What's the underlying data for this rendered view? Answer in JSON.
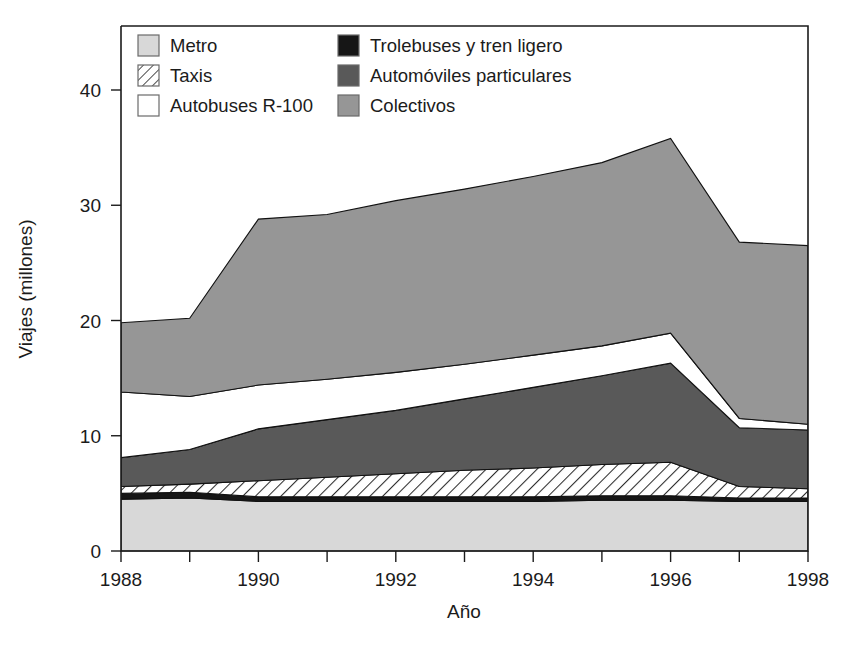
{
  "chart_data": {
    "type": "area",
    "stacked": true,
    "title": "",
    "xlabel": "Año",
    "ylabel": "Viajes (millones)",
    "x": [
      1988,
      1989,
      1990,
      1991,
      1992,
      1993,
      1994,
      1995,
      1996,
      1997,
      1998
    ],
    "xtick_labels": [
      "1988",
      "",
      "1990",
      "",
      "1992",
      "",
      "1994",
      "",
      "1996",
      "",
      "1998"
    ],
    "xlim": [
      1988,
      1998
    ],
    "ylim": [
      0,
      44
    ],
    "ytick_values": [
      0,
      10,
      20,
      30,
      40
    ],
    "ytick_labels": [
      "0",
      "10",
      "20",
      "30",
      "40"
    ],
    "grid": false,
    "legend_position": "top-left-inside",
    "legend_columns": 2,
    "series": [
      {
        "name": "Metro",
        "order": 1,
        "fill": "#d8d8d8",
        "pattern": "solid",
        "values": [
          4.5,
          4.6,
          4.3,
          4.3,
          4.3,
          4.3,
          4.3,
          4.4,
          4.4,
          4.3,
          4.3
        ]
      },
      {
        "name": "Trolebuses y tren ligero",
        "order": 2,
        "fill": "#161616",
        "pattern": "solid",
        "values": [
          0.5,
          0.5,
          0.4,
          0.4,
          0.4,
          0.4,
          0.4,
          0.4,
          0.4,
          0.3,
          0.3
        ]
      },
      {
        "name": "Taxis",
        "order": 3,
        "fill": "#ffffff",
        "pattern": "hatch",
        "values": [
          0.6,
          0.7,
          1.4,
          1.7,
          2.0,
          2.3,
          2.5,
          2.7,
          2.9,
          1.0,
          0.8
        ]
      },
      {
        "name": "Automóviles particulares",
        "order": 4,
        "fill": "#595959",
        "pattern": "solid",
        "values": [
          2.5,
          3.0,
          4.5,
          5.0,
          5.5,
          6.2,
          7.0,
          7.7,
          8.6,
          5.1,
          5.1
        ]
      },
      {
        "name": "Autobuses R-100",
        "order": 5,
        "fill": "#ffffff",
        "pattern": "solid",
        "values": [
          5.7,
          4.6,
          3.8,
          3.5,
          3.3,
          3.0,
          2.8,
          2.6,
          2.6,
          0.8,
          0.5
        ]
      },
      {
        "name": "Colectivos",
        "order": 6,
        "fill": "#969696",
        "pattern": "solid",
        "values": [
          6.0,
          6.8,
          14.4,
          14.3,
          14.9,
          15.2,
          15.5,
          15.9,
          16.9,
          15.3,
          15.5
        ]
      }
    ],
    "cumulative_tops": {
      "Metro": [
        4.5,
        4.6,
        4.3,
        4.3,
        4.3,
        4.3,
        4.3,
        4.4,
        4.4,
        4.3,
        4.3
      ],
      "Trolebuses y tren ligero": [
        5.0,
        5.1,
        4.7,
        4.7,
        4.7,
        4.7,
        4.7,
        4.8,
        4.8,
        4.6,
        4.6
      ],
      "Taxis": [
        5.6,
        5.8,
        6.1,
        6.4,
        6.7,
        7.0,
        7.2,
        7.5,
        7.7,
        5.6,
        5.4
      ],
      "Automóviles particulares": [
        8.1,
        8.8,
        10.6,
        11.4,
        12.2,
        13.2,
        14.2,
        15.2,
        16.3,
        10.7,
        10.5
      ],
      "Autobuses R-100": [
        13.8,
        13.4,
        14.4,
        14.9,
        15.5,
        16.2,
        17.0,
        17.8,
        18.9,
        11.5,
        11.0
      ],
      "Colectivos": [
        19.8,
        20.2,
        28.8,
        29.2,
        30.4,
        31.4,
        32.5,
        33.7,
        35.8,
        26.8,
        26.5
      ]
    }
  },
  "legend": {
    "entries": [
      {
        "label": "Metro",
        "swatch": "#d8d8d8",
        "pattern": "solid"
      },
      {
        "label": "Trolebuses y tren ligero",
        "swatch": "#161616",
        "pattern": "solid"
      },
      {
        "label": "Taxis",
        "swatch": "#ffffff",
        "pattern": "hatch"
      },
      {
        "label": "Automóviles particulares",
        "swatch": "#595959",
        "pattern": "solid"
      },
      {
        "label": "Autobuses R-100",
        "swatch": "#ffffff",
        "pattern": "solid"
      },
      {
        "label": "Colectivos",
        "swatch": "#969696",
        "pattern": "solid"
      }
    ]
  },
  "axes": {
    "y_title": "Viajes (millones)",
    "x_title": "Año",
    "y_ticks": [
      "0",
      "10",
      "20",
      "30",
      "40"
    ],
    "x_ticks": [
      "1988",
      "1990",
      "1992",
      "1994",
      "1996",
      "1998"
    ]
  },
  "colors": {
    "metro": "#d8d8d8",
    "trolebuses": "#161616",
    "taxis": "#ffffff",
    "automoviles": "#595959",
    "autobuses": "#ffffff",
    "colectivos": "#969696",
    "axis": "#1b1b1b",
    "background": "#ffffff"
  }
}
